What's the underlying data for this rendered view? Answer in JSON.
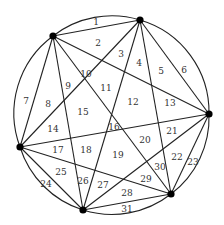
{
  "diagram": {
    "type": "circle-chord-regions",
    "colors": {
      "line": "#222222",
      "point": "#000000",
      "label": "#333333",
      "background": "#ffffff"
    },
    "circle": {
      "cx": 115,
      "cy": 116,
      "r": 96
    },
    "points": [
      {
        "id": "A",
        "x": 53,
        "y": 36
      },
      {
        "id": "B",
        "x": 140,
        "y": 20
      },
      {
        "id": "C",
        "x": 209,
        "y": 114
      },
      {
        "id": "D",
        "x": 171,
        "y": 194
      },
      {
        "id": "E",
        "x": 83,
        "y": 210
      },
      {
        "id": "F",
        "x": 20,
        "y": 147
      }
    ],
    "region_labels": [
      {
        "text": "1",
        "x": 96,
        "y": 22
      },
      {
        "text": "2",
        "x": 98,
        "y": 43
      },
      {
        "text": "3",
        "x": 121,
        "y": 54
      },
      {
        "text": "4",
        "x": 139,
        "y": 63
      },
      {
        "text": "5",
        "x": 161,
        "y": 71
      },
      {
        "text": "6",
        "x": 184,
        "y": 70
      },
      {
        "text": "7",
        "x": 26,
        "y": 101
      },
      {
        "text": "8",
        "x": 48,
        "y": 104
      },
      {
        "text": "9",
        "x": 68,
        "y": 86
      },
      {
        "text": "10",
        "x": 86,
        "y": 74
      },
      {
        "text": "11",
        "x": 106,
        "y": 88
      },
      {
        "text": "12",
        "x": 133,
        "y": 102
      },
      {
        "text": "13",
        "x": 170,
        "y": 103
      },
      {
        "text": "14",
        "x": 53,
        "y": 129
      },
      {
        "text": "15",
        "x": 83,
        "y": 112
      },
      {
        "text": "16",
        "x": 114,
        "y": 127
      },
      {
        "text": "17",
        "x": 58,
        "y": 150
      },
      {
        "text": "18",
        "x": 86,
        "y": 150
      },
      {
        "text": "19",
        "x": 118,
        "y": 155
      },
      {
        "text": "20",
        "x": 145,
        "y": 140
      },
      {
        "text": "21",
        "x": 172,
        "y": 131
      },
      {
        "text": "22",
        "x": 177,
        "y": 157
      },
      {
        "text": "23",
        "x": 193,
        "y": 162
      },
      {
        "text": "24",
        "x": 46,
        "y": 184
      },
      {
        "text": "25",
        "x": 61,
        "y": 172
      },
      {
        "text": "26",
        "x": 83,
        "y": 181
      },
      {
        "text": "27",
        "x": 103,
        "y": 185
      },
      {
        "text": "28",
        "x": 127,
        "y": 193
      },
      {
        "text": "29",
        "x": 146,
        "y": 179
      },
      {
        "text": "30",
        "x": 160,
        "y": 167
      },
      {
        "text": "31",
        "x": 127,
        "y": 209
      }
    ]
  }
}
